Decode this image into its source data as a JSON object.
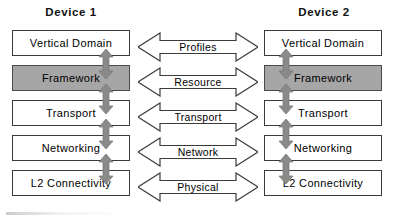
{
  "diagram": {
    "title_device1": "Device 1",
    "title_device2": "Device 2",
    "colors": {
      "shaded_layer": "#a6a6a6",
      "box_border": "#3b3b3b",
      "vertical_arrow": "#8a8a8a",
      "horizontal_arrow_fill": "#ffffff",
      "horizontal_arrow_stroke": "#3b3b3b",
      "background": "#ffffff",
      "text": "#000000"
    },
    "device1": {
      "name": "Device 1",
      "layers": [
        {
          "label": "Vertical Domain",
          "shaded": false
        },
        {
          "label": "Framework",
          "shaded": true
        },
        {
          "label": "Transport",
          "shaded": false
        },
        {
          "label": "Networking",
          "shaded": false
        },
        {
          "label": "L2 Connectivity",
          "shaded": false
        }
      ],
      "vertical_connectors": [
        {
          "name": "vertical-domain-to-framework",
          "style": "double-headed"
        },
        {
          "name": "framework-to-transport",
          "style": "double-headed"
        },
        {
          "name": "transport-to-networking",
          "style": "double-headed"
        },
        {
          "name": "networking-to-l2-connectivity",
          "style": "double-headed"
        }
      ]
    },
    "device2": {
      "name": "Device 2",
      "layers": [
        {
          "label": "Vertical Domain",
          "shaded": false
        },
        {
          "label": "Framework",
          "shaded": true
        },
        {
          "label": "Transport",
          "shaded": false
        },
        {
          "label": "Networking",
          "shaded": false
        },
        {
          "label": "L2 Connectivity",
          "shaded": false
        }
      ],
      "vertical_connectors": [
        {
          "name": "vertical-domain-to-framework",
          "style": "double-headed"
        },
        {
          "name": "framework-to-transport",
          "style": "double-headed"
        },
        {
          "name": "transport-to-networking",
          "style": "double-headed"
        },
        {
          "name": "networking-to-l2-connectivity",
          "style": "double-headed"
        }
      ]
    },
    "peer_links": [
      {
        "label": "Profiles",
        "style": "double-headed"
      },
      {
        "label": "Resource",
        "style": "double-headed"
      },
      {
        "label": "Transport",
        "style": "double-headed"
      },
      {
        "label": "Network",
        "style": "double-headed"
      },
      {
        "label": "Physical",
        "style": "double-headed"
      }
    ]
  }
}
